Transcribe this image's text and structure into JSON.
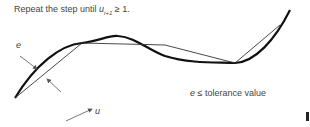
{
  "caption": {
    "prefix": "Repeat the step until ",
    "var": "u",
    "sub": "i+1",
    "suffix": " ≥ 1."
  },
  "labels": {
    "e": "e",
    "u": "u"
  },
  "tolerance": {
    "var": "e",
    "text": " ≤ tolerance value"
  },
  "colors": {
    "curve": "#111111",
    "chord": "#333333",
    "arrow": "#555555",
    "text": "#444444"
  }
}
